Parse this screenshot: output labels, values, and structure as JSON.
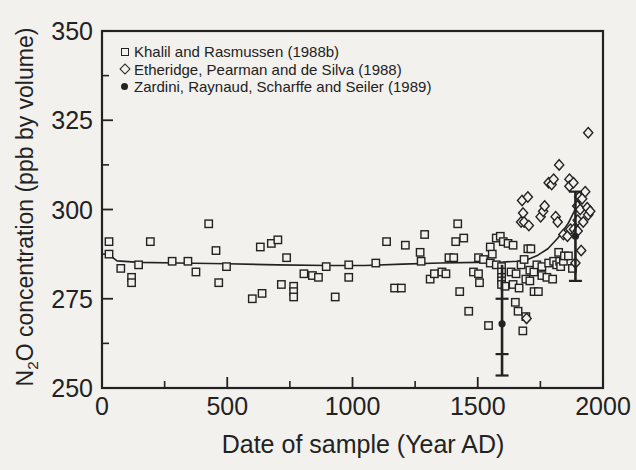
{
  "figure": {
    "background": "#f2f1ed",
    "ink": "#222222"
  },
  "chart_data": {
    "type": "scatter",
    "title": "",
    "xlabel": "Date of sample (Year AD)",
    "ylabel_parts": [
      "N",
      "2",
      "O concentration (ppb by volume)"
    ],
    "xlim": [
      0,
      2000
    ],
    "ylim": [
      250,
      350
    ],
    "x_major_ticks": [
      0,
      500,
      1000,
      1500,
      2000
    ],
    "x_minor_ticks": [
      250,
      750,
      1250,
      1750
    ],
    "y_major_ticks": [
      250,
      275,
      300,
      325,
      350
    ],
    "y_minor_ticks": [
      262.5,
      287.5,
      312.5,
      337.5
    ],
    "grid": false,
    "legend_position": "top-left-inside",
    "legend": [
      {
        "marker": "square-open",
        "label": "Khalil and Rasmussen (1988b)"
      },
      {
        "marker": "diamond-open",
        "label": "Etheridge, Pearman and de Silva (1988)"
      },
      {
        "marker": "circle-filled",
        "label": "Zardini, Raynaud, Scharffe and Seiler (1989)"
      }
    ],
    "series": [
      {
        "name": "Khalil and Rasmussen (1988b)",
        "marker": "square-open",
        "points": [
          [
            28,
            291
          ],
          [
            28,
            287.5
          ],
          [
            75,
            283.5
          ],
          [
            118,
            281
          ],
          [
            118,
            279.5
          ],
          [
            146,
            284.5
          ],
          [
            193,
            291
          ],
          [
            280,
            285.5
          ],
          [
            343,
            285.5
          ],
          [
            375,
            282.5
          ],
          [
            426,
            296
          ],
          [
            455,
            288.5
          ],
          [
            466,
            279.5
          ],
          [
            497,
            284
          ],
          [
            600,
            275
          ],
          [
            632,
            289.5
          ],
          [
            639,
            276.5
          ],
          [
            676,
            290.5
          ],
          [
            702,
            291.5
          ],
          [
            716,
            279
          ],
          [
            737,
            286.5
          ],
          [
            765,
            278.5
          ],
          [
            765,
            277
          ],
          [
            765,
            275.5
          ],
          [
            806,
            282
          ],
          [
            840,
            281.5
          ],
          [
            864,
            281
          ],
          [
            895,
            284
          ],
          [
            931,
            275.5
          ],
          [
            985,
            284.5
          ],
          [
            985,
            281
          ],
          [
            1093,
            285
          ],
          [
            1136,
            291
          ],
          [
            1168,
            278
          ],
          [
            1195,
            278
          ],
          [
            1211,
            290
          ],
          [
            1270,
            288
          ],
          [
            1274,
            285.5
          ],
          [
            1288,
            293
          ],
          [
            1310,
            280.5
          ],
          [
            1327,
            282
          ],
          [
            1357,
            282.5
          ],
          [
            1373,
            282
          ],
          [
            1385,
            286.5
          ],
          [
            1404,
            286.5
          ],
          [
            1412,
            291
          ],
          [
            1420,
            296
          ],
          [
            1428,
            277
          ],
          [
            1444,
            292
          ],
          [
            1464,
            271.5
          ],
          [
            1483,
            282.5
          ],
          [
            1503,
            286.5
          ],
          [
            1503,
            282
          ],
          [
            1507,
            279.5
          ],
          [
            1523,
            286
          ],
          [
            1543,
            267.5
          ],
          [
            1550,
            289.5
          ],
          [
            1550,
            285
          ],
          [
            1558,
            287.5
          ],
          [
            1574,
            292
          ],
          [
            1574,
            284.5
          ],
          [
            1590,
            292.5
          ],
          [
            1595,
            284
          ],
          [
            1595,
            282.5
          ],
          [
            1595,
            281
          ],
          [
            1595,
            280
          ],
          [
            1595,
            279
          ],
          [
            1602,
            291
          ],
          [
            1609,
            278.5
          ],
          [
            1621,
            290.5
          ],
          [
            1633,
            282.5
          ],
          [
            1641,
            290
          ],
          [
            1641,
            279
          ],
          [
            1650,
            274
          ],
          [
            1653,
            282
          ],
          [
            1661,
            271.5
          ],
          [
            1665,
            278
          ],
          [
            1673,
            284.5
          ],
          [
            1680,
            266
          ],
          [
            1685,
            286
          ],
          [
            1692,
            280.5
          ],
          [
            1692,
            270
          ],
          [
            1700,
            289
          ],
          [
            1708,
            283
          ],
          [
            1708,
            280
          ],
          [
            1712,
            289
          ],
          [
            1724,
            282.5
          ],
          [
            1725,
            277
          ],
          [
            1736,
            284.5
          ],
          [
            1742,
            277
          ],
          [
            1756,
            284
          ],
          [
            1756,
            281.5
          ],
          [
            1776,
            281
          ],
          [
            1783,
            285
          ],
          [
            1799,
            280.5
          ],
          [
            1803,
            285.5
          ],
          [
            1815,
            284.5
          ],
          [
            1823,
            288
          ],
          [
            1827,
            285.5
          ],
          [
            1831,
            284
          ],
          [
            1842,
            285.5
          ],
          [
            1846,
            287
          ],
          [
            1862,
            287
          ],
          [
            1878,
            283.5
          ]
        ]
      },
      {
        "name": "Etheridge, Pearman and de Silva (1988)",
        "marker": "diamond-open",
        "points": [
          [
            1673,
            296.5
          ],
          [
            1677,
            302.5
          ],
          [
            1681,
            299
          ],
          [
            1685,
            296.5
          ],
          [
            1695,
            269.5
          ],
          [
            1700,
            303.5
          ],
          [
            1704,
            295.5
          ],
          [
            1751,
            298
          ],
          [
            1761,
            299.5
          ],
          [
            1767,
            301
          ],
          [
            1783,
            307.5
          ],
          [
            1795,
            307
          ],
          [
            1803,
            308.5
          ],
          [
            1811,
            298
          ],
          [
            1819,
            296.5
          ],
          [
            1825,
            312.5
          ],
          [
            1842,
            293
          ],
          [
            1858,
            292.5
          ],
          [
            1866,
            308.5
          ],
          [
            1866,
            306.5
          ],
          [
            1870,
            294.5
          ],
          [
            1882,
            307.5
          ],
          [
            1884,
            294.5
          ],
          [
            1890,
            285
          ],
          [
            1897,
            301
          ],
          [
            1899,
            297
          ],
          [
            1899,
            294
          ],
          [
            1905,
            303.5
          ],
          [
            1909,
            300
          ],
          [
            1913,
            288.5
          ],
          [
            1917,
            303
          ],
          [
            1921,
            296.5
          ],
          [
            1929,
            305
          ],
          [
            1937,
            300.5
          ],
          [
            1941,
            321.5
          ],
          [
            1941,
            298.5
          ],
          [
            1949,
            299.5
          ]
        ]
      },
      {
        "name": "Zardini, Raynaud, Scharffe and Seiler (1989)",
        "marker": "circle-filled",
        "points": [
          {
            "x": 1597,
            "y": 268,
            "err_low": 253.5,
            "err_high": 284.5,
            "caps": [
              253.5,
              259.5,
              275
            ]
          },
          {
            "x": 1890,
            "y": 292.5,
            "err_low": 280,
            "err_high": 305,
            "caps": [
              280,
              305
            ]
          }
        ]
      },
      {
        "name": "smoothed trend",
        "marker": "line",
        "points": [
          [
            25,
            287.5
          ],
          [
            60,
            285.6
          ],
          [
            150,
            285.2
          ],
          [
            300,
            285
          ],
          [
            500,
            284.8
          ],
          [
            700,
            284.5
          ],
          [
            900,
            284.3
          ],
          [
            1050,
            284.3
          ],
          [
            1200,
            284.7
          ],
          [
            1350,
            285
          ],
          [
            1500,
            285.2
          ],
          [
            1600,
            285.3
          ],
          [
            1660,
            285.5
          ],
          [
            1700,
            286
          ],
          [
            1740,
            287.2
          ],
          [
            1780,
            289
          ],
          [
            1820,
            292
          ],
          [
            1860,
            296
          ],
          [
            1885,
            299.5
          ],
          [
            1900,
            302
          ],
          [
            1912,
            304.5
          ]
        ]
      }
    ]
  }
}
